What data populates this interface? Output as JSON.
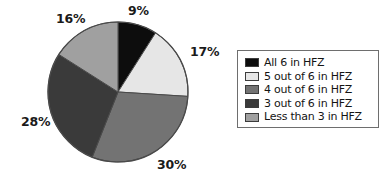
{
  "chart_data": {
    "type": "pie",
    "title": "",
    "subtitle": "",
    "xlabel": "",
    "ylabel": "",
    "legend_position": "right",
    "grid": false,
    "start_angle_deg": 0,
    "direction": "clockwise",
    "categories": [
      "All 6 in HFZ",
      "5 out of 6 in HFZ",
      "4 out of 6 in HFZ",
      "3 out of 6 in HFZ",
      "Less than 3 in HFZ"
    ],
    "values": [
      9,
      17,
      30,
      28,
      16
    ],
    "data_labels": [
      "9%",
      "17%",
      "30%",
      "28%",
      "16%"
    ],
    "colors": [
      "#0d0d0d",
      "#e6e6e6",
      "#737373",
      "#3a3a3a",
      "#a0a0a0"
    ],
    "slices": [
      {
        "label": "All 6 in HFZ",
        "value": 9,
        "data_label": "9%",
        "color": "#0d0d0d"
      },
      {
        "label": "5 out of 6 in HFZ",
        "value": 17,
        "data_label": "17%",
        "color": "#e6e6e6"
      },
      {
        "label": "4 out of 6 in HFZ",
        "value": 30,
        "data_label": "30%",
        "color": "#737373"
      },
      {
        "label": "3 out of 6 in HFZ",
        "value": 28,
        "data_label": "28%",
        "color": "#3a3a3a"
      },
      {
        "label": "Less than 3 in HFZ",
        "value": 16,
        "data_label": "16%",
        "color": "#a0a0a0"
      }
    ]
  },
  "legend": {
    "items": [
      {
        "label": "All 6 in HFZ",
        "color": "#0d0d0d"
      },
      {
        "label": "5 out of 6 in HFZ",
        "color": "#e6e6e6"
      },
      {
        "label": "4 out of 6 in HFZ",
        "color": "#737373"
      },
      {
        "label": "3 out of 6 in HFZ",
        "color": "#3a3a3a"
      },
      {
        "label": "Less than 3 in HFZ",
        "color": "#a0a0a0"
      }
    ]
  },
  "style": {
    "background": "#ffffff",
    "outline": "#4a4a4a",
    "legend_border": "#6e6e6e",
    "label_color": "#1a1a1a"
  }
}
